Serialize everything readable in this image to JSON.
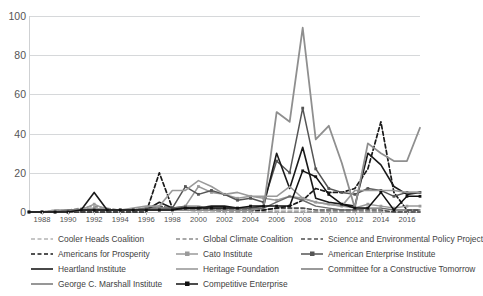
{
  "chart_data": {
    "type": "line",
    "title": "",
    "xlabel": "",
    "ylabel": "",
    "xlim": [
      1987,
      2017
    ],
    "ylim": [
      0,
      100
    ],
    "grid": true,
    "legend_position": "bottom",
    "ytick_labels": [
      "0",
      "20",
      "40",
      "60",
      "80",
      "100"
    ],
    "ytick_values": [
      0,
      20,
      40,
      60,
      80,
      100
    ],
    "xtick_labels": [
      "1988",
      "1990",
      "1992",
      "1994",
      "1996",
      "1998",
      "2000",
      "2002",
      "2004",
      "2006",
      "2008",
      "2010",
      "2012",
      "2014",
      "2016"
    ],
    "xtick_values": [
      1988,
      1990,
      1992,
      1994,
      1996,
      1998,
      2000,
      2002,
      2004,
      2006,
      2008,
      2010,
      2012,
      2014,
      2016
    ],
    "x": [
      1987,
      1988,
      1989,
      1990,
      1991,
      1992,
      1993,
      1994,
      1995,
      1996,
      1997,
      1998,
      1999,
      2000,
      2001,
      2002,
      2003,
      2004,
      2005,
      2006,
      2007,
      2008,
      2009,
      2010,
      2011,
      2012,
      2013,
      2014,
      2015,
      2016,
      2017
    ],
    "series": [
      {
        "name": "Cooler Heads Coalition",
        "color": "#b4b4b4",
        "style": "dashed",
        "width": 1.3,
        "marker": "none",
        "values": [
          0,
          0,
          0,
          0,
          0,
          0,
          0,
          0,
          0,
          1,
          2,
          1,
          1,
          0,
          0,
          1,
          0,
          0,
          0,
          1,
          1,
          1,
          0,
          0,
          0,
          0,
          0,
          0,
          0,
          0,
          0
        ]
      },
      {
        "name": "Global Climate Coalition",
        "color": "#8c8c8c",
        "style": "dashed",
        "width": 1.3,
        "marker": "none",
        "values": [
          0,
          0,
          1,
          1,
          2,
          3,
          2,
          1,
          1,
          2,
          2,
          2,
          2,
          1,
          1,
          0,
          0,
          0,
          0,
          0,
          0,
          0,
          0,
          0,
          0,
          0,
          0,
          0,
          0,
          0,
          0
        ]
      },
      {
        "name": "Science and Environmental Policy Project",
        "color": "#4f4f4f",
        "style": "dashed",
        "width": 1.6,
        "marker": "none",
        "values": [
          0,
          0,
          0,
          0,
          1,
          2,
          1,
          1,
          1,
          2,
          3,
          2,
          2,
          2,
          2,
          1,
          1,
          1,
          1,
          2,
          2,
          2,
          1,
          1,
          1,
          1,
          1,
          1,
          0,
          0,
          0
        ]
      },
      {
        "name": "Americans for Prosperity",
        "color": "#1a1a1a",
        "style": "dashed",
        "width": 1.7,
        "marker": "none",
        "values": [
          0,
          0,
          0,
          0,
          0,
          0,
          0,
          0,
          0,
          0,
          20,
          2,
          1,
          1,
          1,
          1,
          1,
          1,
          1,
          2,
          3,
          6,
          12,
          10,
          10,
          12,
          22,
          46,
          10,
          1,
          1
        ]
      },
      {
        "name": "Cato Institute",
        "color": "#9a9a9a",
        "style": "solid",
        "width": 1.5,
        "marker": "square",
        "values": [
          0,
          0,
          0,
          0,
          1,
          4,
          1,
          1,
          1,
          2,
          2,
          2,
          3,
          13,
          10,
          9,
          7,
          8,
          7,
          6,
          8,
          7,
          5,
          4,
          3,
          2,
          4,
          3,
          2,
          3,
          3
        ]
      },
      {
        "name": "American Enterprise Institute",
        "color": "#555555",
        "style": "solid",
        "width": 1.5,
        "marker": "square",
        "values": [
          0,
          0,
          0,
          0,
          1,
          1,
          1,
          1,
          1,
          1,
          1,
          2,
          13,
          9,
          11,
          9,
          6,
          7,
          5,
          26,
          20,
          53,
          22,
          12,
          10,
          9,
          12,
          11,
          8,
          10,
          10
        ]
      },
      {
        "name": "Heartland Institute",
        "color": "#1a1a1a",
        "style": "solid",
        "width": 1.6,
        "marker": "none",
        "values": [
          0,
          0,
          0,
          0,
          1,
          10,
          1,
          1,
          1,
          1,
          5,
          2,
          2,
          2,
          3,
          3,
          2,
          2,
          3,
          30,
          12,
          33,
          7,
          5,
          4,
          3,
          30,
          24,
          13,
          9,
          10
        ]
      },
      {
        "name": "Heritage Foundation",
        "color": "#9a9a9a",
        "style": "solid",
        "width": 1.6,
        "marker": "none",
        "values": [
          0,
          0,
          1,
          1,
          1,
          2,
          1,
          1,
          2,
          3,
          3,
          11,
          11,
          16,
          13,
          9,
          10,
          8,
          8,
          8,
          13,
          7,
          5,
          4,
          3,
          11,
          11,
          11,
          11,
          10,
          10
        ]
      },
      {
        "name": "Committee for a Constructive Tomorrow",
        "color": "#8f8f8f",
        "style": "solid",
        "width": 1.8,
        "marker": "none",
        "values": [
          0,
          0,
          0,
          0,
          1,
          1,
          1,
          1,
          1,
          1,
          1,
          1,
          1,
          1,
          1,
          1,
          1,
          1,
          2,
          51,
          46,
          94,
          37,
          44,
          25,
          2,
          35,
          30,
          26,
          26,
          43
        ]
      },
      {
        "name": "George C. Marshall Institute",
        "color": "#6b6b6b",
        "style": "solid",
        "width": 1.4,
        "marker": "none",
        "values": [
          0,
          0,
          0,
          1,
          1,
          1,
          1,
          1,
          1,
          2,
          2,
          2,
          3,
          3,
          2,
          2,
          2,
          2,
          2,
          5,
          8,
          6,
          3,
          2,
          1,
          1,
          2,
          2,
          1,
          1,
          1
        ]
      },
      {
        "name": "Competitive Enterprise",
        "color": "#111111",
        "style": "solid",
        "width": 1.5,
        "marker": "square",
        "values": [
          0,
          0,
          0,
          0,
          1,
          1,
          1,
          1,
          1,
          1,
          1,
          1,
          2,
          2,
          2,
          2,
          2,
          3,
          3,
          3,
          3,
          21,
          18,
          9,
          4,
          2,
          2,
          10,
          1,
          8,
          8
        ]
      }
    ]
  },
  "legend": {
    "items": [
      {
        "label": "Cooler Heads Coalition",
        "col": 0,
        "row": 0
      },
      {
        "label": "Global Climate Coalition",
        "col": 1,
        "row": 0
      },
      {
        "label": "Science and Environmental Policy Project",
        "col": 2,
        "row": 0
      },
      {
        "label": "Americans for Prosperity",
        "col": 0,
        "row": 1
      },
      {
        "label": "Cato Institute",
        "col": 1,
        "row": 1
      },
      {
        "label": "American Enterprise Institute",
        "col": 2,
        "row": 1
      },
      {
        "label": "Heartland Institute",
        "col": 0,
        "row": 2
      },
      {
        "label": "Heritage Foundation",
        "col": 1,
        "row": 2
      },
      {
        "label": "Committee for a Constructive Tomorrow",
        "col": 2,
        "row": 2
      },
      {
        "label": "George C. Marshall Institute",
        "col": 0,
        "row": 3
      },
      {
        "label": "Competitive Enterprise",
        "col": 1,
        "row": 3
      }
    ]
  }
}
